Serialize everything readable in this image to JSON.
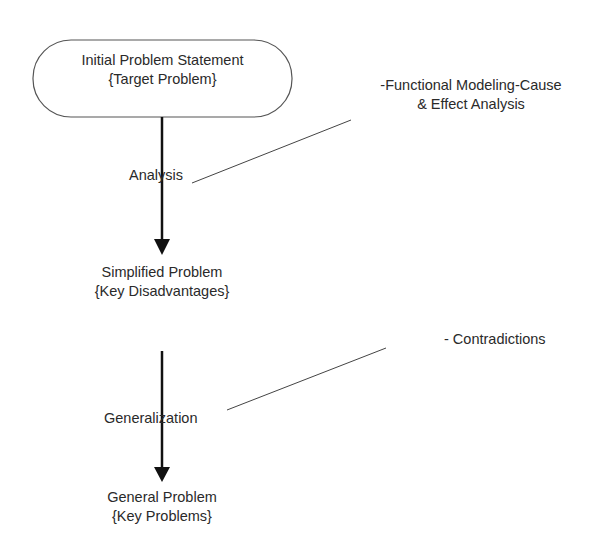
{
  "diagram": {
    "nodes": [
      {
        "id": "initial",
        "line1": "Initial Problem Statement",
        "line2": "{Target Problem}",
        "shape": "rounded-oval"
      },
      {
        "id": "simplified",
        "line1": "Simplified Problem",
        "line2": "{Key Disadvantages}",
        "shape": "text"
      },
      {
        "id": "general",
        "line1": "General Problem",
        "line2": "{Key Problems}",
        "shape": "text"
      }
    ],
    "edges": [
      {
        "from": "initial",
        "to": "simplified",
        "label": "Analysis"
      },
      {
        "from": "simplified",
        "to": "general",
        "label": "Generalization"
      }
    ],
    "annotations": [
      {
        "attached_to": "Analysis",
        "line1": "-Functional Modeling-Cause",
        "line2": "& Effect Analysis"
      },
      {
        "attached_to": "Generalization",
        "line1": "- Contradictions"
      }
    ]
  }
}
